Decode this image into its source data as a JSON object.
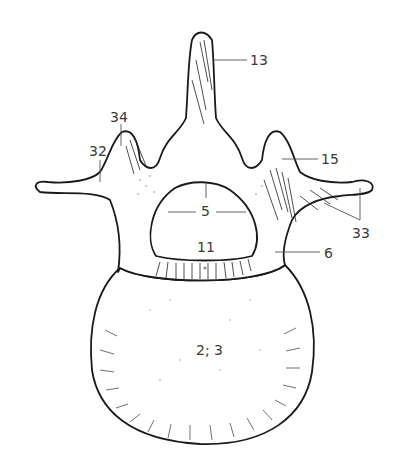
{
  "figure": {
    "labels": [
      {
        "id": "13",
        "text": "13",
        "x": 250,
        "y": 53
      },
      {
        "id": "34",
        "text": "34",
        "x": 110,
        "y": 110
      },
      {
        "id": "32",
        "text": "32",
        "x": 89,
        "y": 144
      },
      {
        "id": "15",
        "text": "15",
        "x": 321,
        "y": 152
      },
      {
        "id": "5",
        "text": "5",
        "x": 201,
        "y": 204
      },
      {
        "id": "11",
        "text": "11",
        "x": 197,
        "y": 240
      },
      {
        "id": "6",
        "text": "6",
        "x": 324,
        "y": 246
      },
      {
        "id": "33",
        "text": "33",
        "x": 352,
        "y": 226
      },
      {
        "id": "2-3",
        "text": "2; 3",
        "x": 196,
        "y": 343
      }
    ]
  }
}
